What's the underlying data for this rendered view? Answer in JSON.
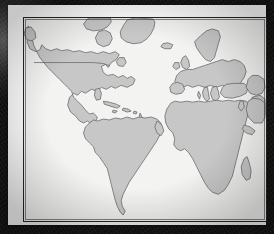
{
  "artwork": {
    "type": "framed-world-map-print",
    "title": "World Map",
    "projection": "Atlantic-centered equirectangular",
    "hemisphere_coverage": "Western Europe, Africa, North America, South America",
    "caption": "",
    "colors": {
      "ocean": "#f3f3f1",
      "land": "#c7c7c7",
      "coastline": "#6b6b6b",
      "political_border": "#5e5e5e",
      "plate_rule": "#26262a",
      "mat": "#ffffff",
      "backdrop": "#1a1a1a"
    }
  },
  "map": {
    "landmasses": [
      {
        "name": "Greenland",
        "label": ""
      },
      {
        "name": "North America",
        "label": ""
      },
      {
        "name": "Central America",
        "label": ""
      },
      {
        "name": "Caribbean Islands",
        "label": ""
      },
      {
        "name": "South America",
        "label": ""
      },
      {
        "name": "Iceland",
        "label": ""
      },
      {
        "name": "British Isles",
        "label": ""
      },
      {
        "name": "Scandinavia",
        "label": ""
      },
      {
        "name": "Europe",
        "label": ""
      },
      {
        "name": "Africa",
        "label": ""
      },
      {
        "name": "Madagascar",
        "label": ""
      },
      {
        "name": "Arabian Peninsula",
        "label": ""
      },
      {
        "name": "Middle East",
        "label": ""
      },
      {
        "name": "Western Asia",
        "label": ""
      },
      {
        "name": "Mediterranean Islands",
        "label": ""
      }
    ],
    "political_borders": [
      {
        "name": "United States - Canada border",
        "label": ""
      }
    ],
    "graticule": false,
    "labels_visible": false,
    "legend_visible": false,
    "scale_bar_visible": false
  },
  "frame": {
    "mat_color": "#ffffff",
    "rule_color": "#26262a",
    "style": "white mat with thin dark keyline"
  }
}
